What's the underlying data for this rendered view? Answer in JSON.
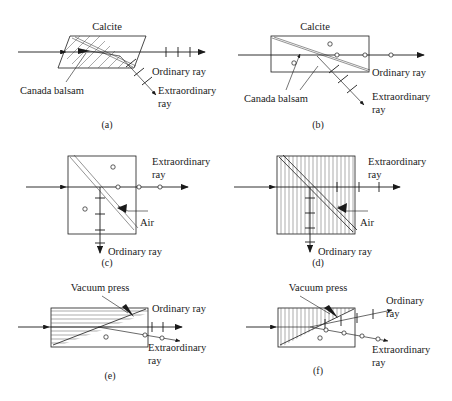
{
  "figure": {
    "panels": [
      {
        "id": "a",
        "caption": "(a)",
        "labels": {
          "material": "Calcite",
          "cement": "Canada balsam",
          "ordinary": "Ordinary ray",
          "extraordinary_line1": "Extraordinary",
          "extraordinary_line2": "ray"
        },
        "shape": "parallelogram",
        "hatching": "diagonal",
        "ordinary_marker": "tick",
        "extraordinary_marker": "tick"
      },
      {
        "id": "b",
        "caption": "(b)",
        "labels": {
          "material": "Calcite",
          "cement": "Canada balsam",
          "ordinary": "Ordinary ray",
          "extraordinary_line1": "Extraordinary",
          "extraordinary_line2": "ray"
        },
        "shape": "rectangle",
        "hatching": "none",
        "ordinary_marker": "circle",
        "extraordinary_marker": "tick"
      },
      {
        "id": "c",
        "caption": "(c)",
        "labels": {
          "gap": "Air",
          "ordinary": "Ordinary ray",
          "extraordinary_line1": "Extraordinary",
          "extraordinary_line2": "ray"
        },
        "shape": "square",
        "hatching": "none",
        "ordinary_marker": "tick",
        "extraordinary_marker": "circle"
      },
      {
        "id": "d",
        "caption": "(d)",
        "labels": {
          "gap": "Air",
          "ordinary": "Ordinary ray",
          "extraordinary_line1": "Extraordinary",
          "extraordinary_line2": "ray"
        },
        "shape": "square",
        "hatching": "vertical",
        "ordinary_marker": "tick",
        "extraordinary_marker": "tick"
      },
      {
        "id": "e",
        "caption": "(e)",
        "labels": {
          "press": "Vacuum press",
          "ordinary": "Ordinary ray",
          "extraordinary_line1": "Extraordinary",
          "extraordinary_line2": "ray"
        },
        "shape": "rectangle",
        "hatching": "horizontal",
        "ordinary_marker": "tick",
        "extraordinary_marker": "circle"
      },
      {
        "id": "f",
        "caption": "(f)",
        "labels": {
          "press": "Vacuum press",
          "ordinary_line1": "Ordinary",
          "ordinary_line2": "ray",
          "extraordinary_line1": "Extraordinary",
          "extraordinary_line2": "ray"
        },
        "shape": "rectangle",
        "hatching": "vertical",
        "ordinary_marker": "tick",
        "extraordinary_marker": "circle"
      }
    ],
    "colors": {
      "line": "#1a1a1a",
      "hatch": "#555555",
      "background": "#ffffff"
    }
  }
}
